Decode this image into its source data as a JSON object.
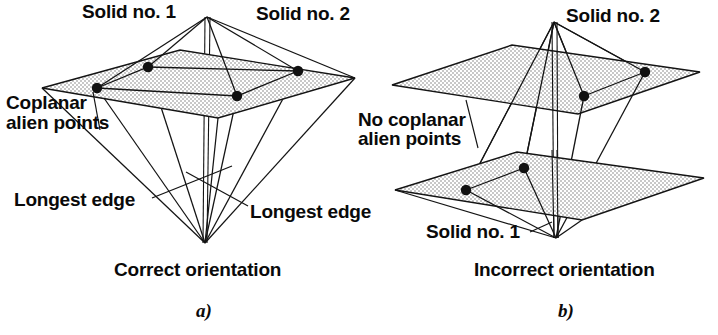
{
  "figure": {
    "width": 718,
    "height": 335,
    "background": "#ffffff",
    "ink_color": "#141414",
    "plane_fill": "#e8e8e8",
    "dot_color": "#111111"
  },
  "panel_a": {
    "letter": "a)",
    "caption": "Correct orientation",
    "labels": {
      "solid_1": "Solid no. 1",
      "solid_2": "Solid no. 2",
      "alien_points_line1": "Coplanar",
      "alien_points_line2": "alien points",
      "longest_edge_left": "Longest edge",
      "longest_edge_right": "Longest edge"
    },
    "geometry": {
      "top_apex": [
        207,
        17
      ],
      "bottom_apex": [
        205,
        243
      ],
      "plane_corners": [
        [
          42,
          88
        ],
        [
          180,
          50
        ],
        [
          355,
          78
        ],
        [
          218,
          118
        ]
      ],
      "alien_points": [
        [
          97,
          88
        ],
        [
          148,
          67
        ],
        [
          237,
          96
        ],
        [
          298,
          71
        ]
      ]
    }
  },
  "panel_b": {
    "letter": "b)",
    "caption": "Incorrect orientation",
    "labels": {
      "solid_1": "Solid no. 1",
      "solid_2": "Solid no. 2",
      "alien_points_line1": "No coplanar",
      "alien_points_line2": "alien points"
    },
    "geometry": {
      "top_apex": [
        554,
        22
      ],
      "bottom_apex": [
        556,
        238
      ],
      "upper_plane_corners": [
        [
          392,
          85
        ],
        [
          512,
          45
        ],
        [
          700,
          72
        ],
        [
          578,
          114
        ]
      ],
      "lower_plane_corners": [
        [
          395,
          190
        ],
        [
          517,
          152
        ],
        [
          704,
          178
        ],
        [
          582,
          220
        ]
      ],
      "upper_alien_points": [
        [
          584,
          96
        ],
        [
          645,
          72
        ]
      ],
      "lower_alien_points": [
        [
          466,
          190
        ],
        [
          524,
          168
        ]
      ]
    }
  }
}
